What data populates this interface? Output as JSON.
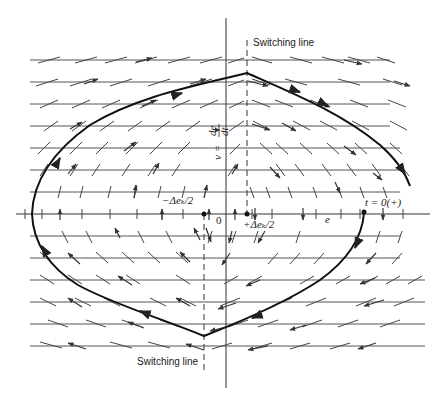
{
  "figure": {
    "type": "phase-plane diagram",
    "labels": {
      "switching_line_top": "Switching line",
      "switching_line_bottom": "Switching line",
      "y_axis": "v = de/dt",
      "y_axis_numerator": "de",
      "y_axis_denominator": "dt",
      "y_axis_prefix": "v =",
      "x_axis": "e",
      "origin": "0",
      "minus_half_deadband": "−Δeₖ/2",
      "plus_half_deadband": "+Δeₖ/2",
      "start_point": "t = 0(+)"
    },
    "colors": {
      "ink": "#222222",
      "grid": "#555555",
      "background": "#ffffff"
    },
    "geometry": {
      "axis_x": 226,
      "axis_y": 214,
      "switching_line_upper_x": 247,
      "switching_line_lower_x": 204,
      "grid_rows_y": [
        60,
        82,
        104,
        126,
        148,
        170,
        192,
        214,
        236,
        258,
        280,
        302,
        324,
        346
      ],
      "trajectory": {
        "start": [
          364,
          213
        ],
        "top_apex": [
          247,
          73
        ],
        "leftmost": [
          32,
          214
        ],
        "bottom_apex": [
          204,
          336
        ],
        "end_upper_right": [
          410,
          186
        ]
      }
    }
  }
}
